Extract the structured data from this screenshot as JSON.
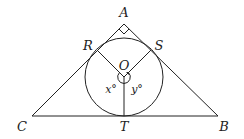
{
  "diagram": {
    "type": "geometry",
    "colors": {
      "stroke": "#222222",
      "background": "#ffffff"
    },
    "points": {
      "A": {
        "label": "A",
        "x": 124,
        "y": 24
      },
      "B": {
        "label": "B",
        "x": 218,
        "y": 116
      },
      "C": {
        "label": "C",
        "x": 32,
        "y": 116
      },
      "O": {
        "label": "O",
        "x": 124,
        "y": 77
      },
      "R": {
        "label": "R",
        "x": 97,
        "y": 50
      },
      "S": {
        "label": "S",
        "x": 151,
        "y": 50
      },
      "T": {
        "label": "T",
        "x": 124,
        "y": 116
      }
    },
    "circle": {
      "center": "O",
      "radius": 39
    },
    "angles": {
      "x": {
        "label": "x°"
      },
      "y": {
        "label": "y°"
      }
    },
    "right_angle_marker": {
      "at": "A"
    }
  }
}
